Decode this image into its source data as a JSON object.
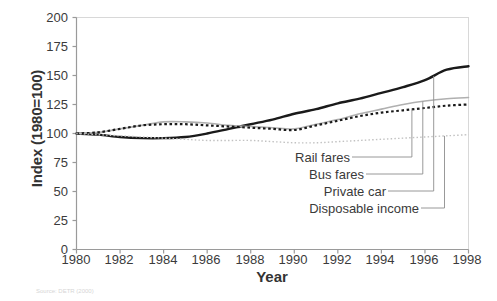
{
  "chart_data": {
    "type": "line",
    "title": "",
    "xlabel": "Year",
    "ylabel": "Index (1980=100)",
    "xlim": [
      1980,
      1998
    ],
    "ylim": [
      0,
      200
    ],
    "xticks": [
      1980,
      1982,
      1984,
      1986,
      1988,
      1990,
      1992,
      1994,
      1996,
      1998
    ],
    "yticks": [
      0,
      25,
      50,
      75,
      100,
      125,
      150,
      175,
      200
    ],
    "grid": false,
    "legend_position": "inline-labels-bottom-right",
    "x": [
      1980,
      1981,
      1982,
      1983,
      1984,
      1985,
      1986,
      1987,
      1988,
      1989,
      1990,
      1991,
      1992,
      1993,
      1994,
      1995,
      1996,
      1997,
      1998
    ],
    "series": [
      {
        "name": "Private car",
        "style": "solid",
        "color": "#1a1a1a",
        "width": 2.4,
        "values": [
          100,
          99,
          97,
          96,
          96,
          97,
          100,
          104,
          108,
          112,
          117,
          121,
          126,
          130,
          135,
          140,
          146,
          155,
          158
        ]
      },
      {
        "name": "Bus fares",
        "style": "solid",
        "color": "#b0b0b0",
        "width": 1.6,
        "values": [
          100,
          101,
          104,
          107,
          110,
          110,
          109,
          107,
          106,
          105,
          104,
          108,
          112,
          117,
          121,
          125,
          128,
          130,
          131
        ]
      },
      {
        "name": "Rail fares",
        "style": "dotted-square",
        "color": "#1a1a1a",
        "width": 2.2,
        "values": [
          100,
          101,
          104,
          107,
          108,
          108,
          107,
          106,
          105,
          104,
          103,
          107,
          111,
          115,
          118,
          120,
          122,
          124,
          125
        ]
      },
      {
        "name": "Disposable income",
        "style": "fine-dotted",
        "color": "#c2c2c2",
        "width": 1.4,
        "values": [
          100,
          99,
          98,
          97,
          96,
          95,
          94,
          94,
          94,
          93,
          92,
          92,
          93,
          94,
          95,
          96,
          97,
          98,
          99
        ]
      }
    ],
    "annotations": [
      {
        "label": "Rail fares",
        "target_series": "Rail fares"
      },
      {
        "label": "Bus fares",
        "target_series": "Bus fares"
      },
      {
        "label": "Private car",
        "target_series": "Private car"
      },
      {
        "label": "Disposable income",
        "target_series": "Disposable income"
      }
    ],
    "source_note": "Source: DETR (2000)"
  }
}
